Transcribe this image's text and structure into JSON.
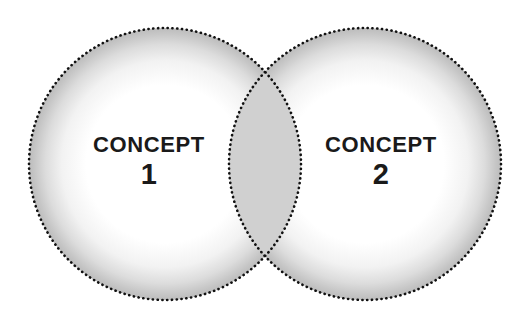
{
  "diagram": {
    "type": "venn-two-set",
    "background_color": "#ffffff",
    "canvas": {
      "width": 527,
      "height": 327
    },
    "stroke": {
      "style": "dotted",
      "color": "#111111",
      "dot_diameter_px": 2,
      "dot_gap_px": 3
    },
    "fill": {
      "circle_color": "#ffffff",
      "inner_glow_color": "#b8b8b8",
      "overlap_color": "#d0d0d0"
    },
    "circles": [
      {
        "id": "left",
        "name": "concept-1-circle",
        "cx": 165,
        "cy": 164,
        "r": 136
      },
      {
        "id": "right",
        "name": "concept-2-circle",
        "cx": 365,
        "cy": 164,
        "r": 136
      }
    ],
    "overlap": {
      "name": "intersection-region",
      "top_point": {
        "x": 265,
        "y": 78
      },
      "bottom_point": {
        "x": 265,
        "y": 250
      },
      "label": ""
    },
    "labels": {
      "left": {
        "title": "CONCEPT",
        "number": "1",
        "text_color": "#1a1a1a"
      },
      "right": {
        "title": "CONCEPT",
        "number": "2",
        "text_color": "#1a1a1a"
      }
    }
  }
}
